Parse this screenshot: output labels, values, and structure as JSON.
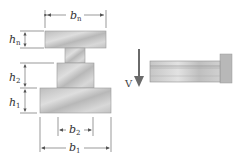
{
  "figure": {
    "cross_section": {
      "labels": {
        "b_n": {
          "base": "b",
          "sub": "n"
        },
        "h_n": {
          "base": "h",
          "sub": "n"
        },
        "h_2": {
          "base": "h",
          "sub": "2"
        },
        "h_1": {
          "base": "h",
          "sub": "1"
        },
        "b_2": {
          "base": "b",
          "sub": "2"
        },
        "b_1": {
          "base": "b",
          "sub": "1"
        }
      }
    },
    "beam_side_view": {
      "load_label": "V"
    },
    "colors": {
      "section_fill": "#c9c9c9",
      "section_stroke": "#8a8a8a",
      "dimension_line": "#555555",
      "wall_fill": "#b5b5b5"
    }
  }
}
